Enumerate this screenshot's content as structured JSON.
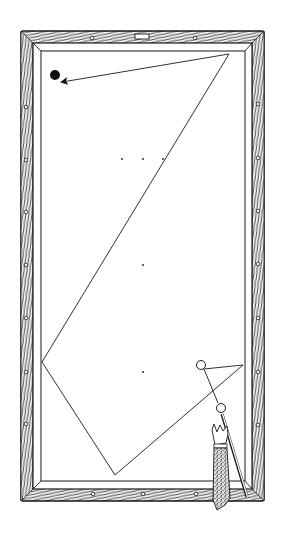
{
  "figure": {
    "width": 281,
    "height": 540
  },
  "colors": {
    "background": "#ffffff",
    "ink": "#1a1a1a",
    "bed": "#ffffff",
    "rail_wood": "#f2f2f2"
  },
  "table": {
    "outer": {
      "x": 21,
      "y": 31,
      "w": 243,
      "h": 470
    },
    "cushion": {
      "x": 33,
      "y": 43,
      "w": 219,
      "h": 446
    },
    "bed": {
      "x": 41,
      "y": 51,
      "w": 204,
      "h": 430
    },
    "nameplate": {
      "x": 135,
      "y": 34,
      "w": 14,
      "h": 5
    },
    "diamonds": {
      "top": [
        [
          92,
          38
        ],
        [
          195,
          38
        ]
      ],
      "bottom": [
        [
          93,
          494
        ],
        [
          143,
          494
        ],
        [
          196,
          494
        ]
      ],
      "left": [
        [
          26,
          107
        ],
        [
          26,
          160
        ],
        [
          26,
          212
        ],
        [
          26,
          265
        ],
        [
          26,
          318
        ],
        [
          26,
          372
        ],
        [
          26,
          424
        ]
      ],
      "right": [
        [
          258,
          104
        ],
        [
          258,
          158
        ],
        [
          258,
          211
        ],
        [
          258,
          264
        ],
        [
          258,
          318
        ],
        [
          258,
          372
        ],
        [
          258,
          425
        ]
      ]
    },
    "spots": [
      [
        122,
        159
      ],
      [
        143,
        159
      ],
      [
        163,
        159
      ],
      [
        143,
        265
      ],
      [
        143,
        372
      ]
    ]
  },
  "balls": {
    "target_ball": {
      "cx": 55,
      "cy": 75,
      "r": 5,
      "fill": "#111111"
    },
    "object_ball": {
      "cx": 201,
      "cy": 365,
      "r": 4.5,
      "fill": "#ffffff"
    },
    "cue_ball": {
      "cx": 221,
      "cy": 408,
      "r": 4.5,
      "fill": "#ffffff"
    }
  },
  "ball_path": {
    "points": [
      [
        218,
        403
      ],
      [
        204,
        369
      ],
      [
        243,
        365
      ],
      [
        115,
        475
      ],
      [
        42,
        362
      ],
      [
        229,
        54
      ],
      [
        62,
        82
      ]
    ],
    "arrow_tip": [
      61,
      81
    ]
  },
  "cue": {
    "stick": [
      [
        222,
        414
      ],
      [
        247,
        497
      ]
    ],
    "arm": {
      "hand": [
        220,
        437
      ],
      "sleeve_bottom": [
        216,
        510
      ]
    }
  }
}
